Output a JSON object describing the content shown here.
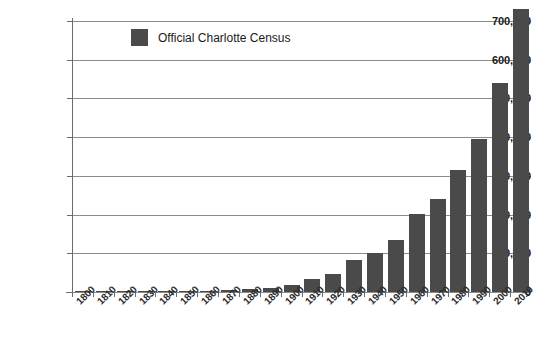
{
  "chart_data": {
    "type": "bar",
    "title": "",
    "xlabel": "",
    "ylabel": "",
    "grid": true,
    "legend_position": "top-left",
    "ylim": [
      0,
      700000
    ],
    "xlim": [
      "1800",
      "2010"
    ],
    "yticks": [
      0,
      100000,
      200000,
      300000,
      400000,
      500000,
      600000,
      700000
    ],
    "ytick_labels": [
      "0",
      "100,000",
      "200,000",
      "300,000",
      "400,000",
      "500,000",
      "600,000",
      "700,000"
    ],
    "categories": [
      "1800",
      "1810",
      "1820",
      "1830",
      "1840",
      "1850",
      "1860",
      "1870",
      "1880",
      "1890",
      "1900",
      "1910",
      "1920",
      "1930",
      "1940",
      "1950",
      "1960",
      "1970",
      "1980",
      "1990",
      "2000",
      "2010"
    ],
    "series": [
      {
        "name": "Official Charlotte Census",
        "color": "#4a4a4a",
        "values": [
          276,
          870,
          800,
          717,
          800,
          1065,
          2265,
          4473,
          7094,
          11557,
          18091,
          34014,
          46338,
          82675,
          100899,
          134042,
          201564,
          241178,
          314447,
          395934,
          540828,
          731424
        ]
      }
    ]
  },
  "legend": {
    "entries": [
      {
        "label": "Official Charlotte Census",
        "color": "#4a4a4a"
      }
    ]
  },
  "axis": {
    "y_labels": [
      "700,000",
      "600,000",
      "500,000",
      "400,000",
      "300,000",
      "200,000",
      "100,000",
      "0"
    ],
    "x_labels": [
      "1800",
      "1810",
      "1820",
      "1830",
      "1840",
      "1850",
      "1860",
      "1870",
      "1880",
      "1890",
      "1900",
      "1910",
      "1920",
      "1930",
      "1940",
      "1950",
      "1960",
      "1970",
      "1980",
      "1990",
      "2000",
      "2010"
    ]
  }
}
